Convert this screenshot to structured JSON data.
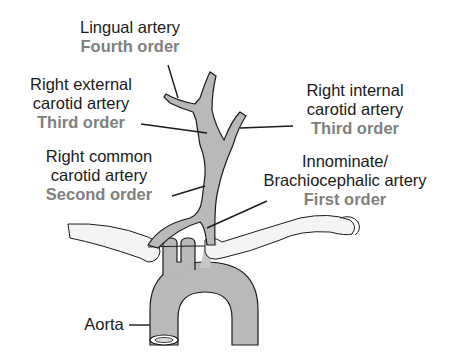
{
  "diagram": {
    "colors": {
      "vessel_fill": "#b9b9b9",
      "outline": "#1a1a1a",
      "bone_fill": "#f4f4f4",
      "order_text": "#808080",
      "name_text": "#1a1a1a"
    },
    "labels": [
      {
        "id": "lingual",
        "name": "Lingual artery",
        "order": "Fourth order"
      },
      {
        "id": "right_external_carotid",
        "name_lines": [
          "Right external",
          "carotid artery"
        ],
        "order": "Third order"
      },
      {
        "id": "right_internal_carotid",
        "name_lines": [
          "Right internal",
          "carotid artery"
        ],
        "order": "Third order"
      },
      {
        "id": "right_common_carotid",
        "name_lines": [
          "Right common",
          "carotid artery"
        ],
        "order": "Second order"
      },
      {
        "id": "innominate",
        "name_lines": [
          "Innominate/",
          "Brachiocephalic artery"
        ],
        "order": "First order"
      },
      {
        "id": "aorta",
        "name": "Aorta"
      }
    ]
  }
}
